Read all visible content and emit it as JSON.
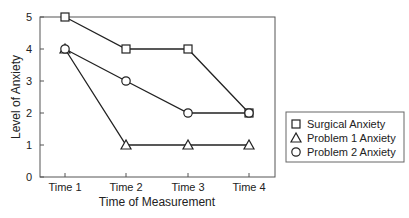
{
  "chart_data": {
    "type": "line",
    "title": "",
    "xlabel": "Time of Measurement",
    "ylabel": "Level of Anxiety",
    "categories": [
      "Time 1",
      "Time 2",
      "Time 3",
      "Time 4"
    ],
    "ylim": [
      0,
      5
    ],
    "yticks": [
      "0",
      "1",
      "2",
      "3",
      "4",
      "5"
    ],
    "grid": false,
    "legend_position": "right",
    "series": [
      {
        "name": "Surgical Anxiety",
        "marker": "square",
        "values": [
          5,
          4,
          4,
          2
        ]
      },
      {
        "name": "Problem 1 Anxiety",
        "marker": "triangle",
        "values": [
          4,
          1,
          1,
          1
        ]
      },
      {
        "name": "Problem 2 Anxiety",
        "marker": "circle",
        "values": [
          4,
          3,
          2,
          2
        ]
      }
    ]
  }
}
